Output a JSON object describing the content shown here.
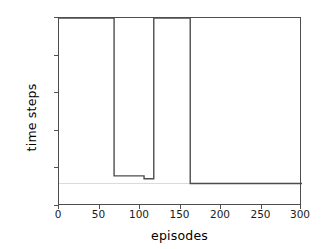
{
  "chart_data": {
    "type": "line",
    "title": "",
    "xlabel": "episodes",
    "ylabel": "time steps",
    "xlim": [
      0,
      300
    ],
    "ylim": [
      0,
      100
    ],
    "xticks": [
      0,
      50,
      100,
      150,
      200,
      250,
      300
    ],
    "yticks": [
      0,
      20,
      40,
      60,
      80,
      100
    ],
    "grid": false,
    "legend": null,
    "line_color": "#4d4d4d",
    "reference_line": {
      "label": "",
      "y": 12,
      "color": "#d9d9d9",
      "x_from": 0,
      "x_to": 300
    },
    "series": [
      {
        "name": "time steps",
        "x": [
          0,
          68,
          68,
          105,
          105,
          117,
          117,
          118,
          118,
          162,
          162,
          300
        ],
        "values": [
          100,
          100,
          16,
          16,
          14.5,
          14.5,
          100,
          100,
          100,
          100,
          12,
          12
        ]
      }
    ],
    "annotations": [
      "Line saturates at 100 time steps until episode ~68",
      "Dips to ~16 time steps between episodes ~68 and ~105",
      "Steps to ~14.5 between episodes ~105 and ~117",
      "Returns to 100 between episodes ~117 and ~162",
      "Converges to ~12 time steps from episode ~162 to 300"
    ]
  }
}
